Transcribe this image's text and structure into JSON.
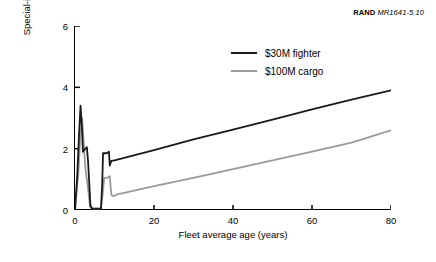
{
  "credit": {
    "brand": "RAND",
    "code": "MR1641-5.10"
  },
  "chart_data": {
    "type": "line",
    "title": "",
    "xlabel": "Fleet average age (years)",
    "ylabel": "Special-inspection workload (MMH/FH)",
    "xlim": [
      0,
      80
    ],
    "ylim": [
      0,
      6
    ],
    "xticks": [
      0,
      20,
      40,
      60,
      80
    ],
    "yticks": [
      0,
      2,
      4,
      6
    ],
    "grid": false,
    "legend_position": "top-center",
    "series": [
      {
        "name": "$30M fighter",
        "color": "#1a1a1a",
        "points": [
          [
            0.0,
            0.0
          ],
          [
            0.6,
            1.2
          ],
          [
            1.0,
            2.4
          ],
          [
            1.4,
            3.4
          ],
          [
            1.8,
            2.6
          ],
          [
            2.0,
            1.9
          ],
          [
            2.3,
            1.95
          ],
          [
            2.7,
            2.0
          ],
          [
            3.0,
            2.05
          ],
          [
            3.3,
            1.6
          ],
          [
            3.6,
            0.9
          ],
          [
            3.9,
            0.15
          ],
          [
            4.3,
            0.05
          ],
          [
            5.0,
            0.04
          ],
          [
            6.0,
            0.04
          ],
          [
            6.6,
            0.05
          ],
          [
            6.9,
            0.9
          ],
          [
            7.1,
            1.85
          ],
          [
            8.0,
            1.85
          ],
          [
            8.6,
            1.9
          ],
          [
            8.8,
            1.45
          ],
          [
            9.2,
            1.6
          ],
          [
            10.0,
            1.62
          ],
          [
            20.0,
            1.95
          ],
          [
            30.0,
            2.3
          ],
          [
            40.0,
            2.62
          ],
          [
            50.0,
            2.95
          ],
          [
            60.0,
            3.28
          ],
          [
            70.0,
            3.6
          ],
          [
            80.0,
            3.9
          ]
        ]
      },
      {
        "name": "$100M cargo",
        "color": "#9a9a9a",
        "points": [
          [
            0.0,
            0.0
          ],
          [
            0.8,
            1.1
          ],
          [
            1.3,
            2.3
          ],
          [
            1.8,
            3.0
          ],
          [
            2.2,
            2.2
          ],
          [
            2.6,
            1.4
          ],
          [
            3.0,
            1.0
          ],
          [
            3.4,
            0.6
          ],
          [
            3.8,
            0.1
          ],
          [
            4.5,
            0.04
          ],
          [
            5.5,
            0.04
          ],
          [
            6.5,
            0.05
          ],
          [
            7.0,
            0.5
          ],
          [
            7.4,
            1.05
          ],
          [
            8.2,
            1.05
          ],
          [
            8.8,
            1.1
          ],
          [
            9.2,
            0.5
          ],
          [
            9.8,
            0.45
          ],
          [
            10.5,
            0.5
          ],
          [
            20.0,
            0.78
          ],
          [
            30.0,
            1.05
          ],
          [
            40.0,
            1.33
          ],
          [
            50.0,
            1.62
          ],
          [
            60.0,
            1.9
          ],
          [
            70.0,
            2.2
          ],
          [
            80.0,
            2.6
          ]
        ]
      }
    ]
  }
}
